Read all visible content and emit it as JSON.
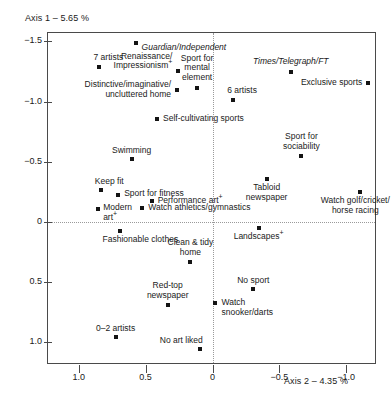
{
  "figure": {
    "axis1_label": "Axis 1 – 5.65 %",
    "axis2_label": "Axis 2 – 4.35 %"
  },
  "chart_data": {
    "type": "scatter",
    "title": "",
    "xlabel": "Axis 2 – 4.35 %",
    "ylabel": "Axis 1 – 5.65 %",
    "xlim": [
      1.23,
      -1.23
    ],
    "ylim": [
      -1.57,
      1.19
    ],
    "x_reversed": true,
    "y_reversed": true,
    "grid": false,
    "legend": "none",
    "zero_lines": true,
    "xticks": [
      1.0,
      0.5,
      0,
      -0.5,
      -1.0
    ],
    "xticklabels": [
      "1.0",
      "0.5",
      "0",
      "-0.5",
      "-1.0"
    ],
    "yticks": [
      -1.5,
      -1.0,
      -0.5,
      0,
      0.5,
      1.0
    ],
    "yticklabels": [
      "-1.5",
      "-1.0",
      "-0.5",
      "0",
      "0.5",
      "1.0"
    ],
    "points": [
      {
        "label": "Guardian/Independent",
        "x": 0.575,
        "y": -1.485,
        "italic": true,
        "anchor": "start",
        "dx": 6,
        "dy": 0,
        "lines": [
          "Guardian/Independent"
        ]
      },
      {
        "label": "7 artists",
        "x": 0.845,
        "y": -1.285,
        "italic": false,
        "anchor": "start",
        "dx": -6,
        "dy": -14,
        "lines": [
          "7 artists"
        ]
      },
      {
        "label": "Renaissance/Impressionism+",
        "x": 0.255,
        "y": -1.255,
        "italic": false,
        "anchor": "end",
        "dx": -6,
        "dy": -19,
        "lines": [
          "Renaissance/",
          "Impressionism+"
        ]
      },
      {
        "label": "Times/Telegraph/FT",
        "x": -0.585,
        "y": -1.245,
        "italic": true,
        "anchor": "mid",
        "dx": 0,
        "dy": -15,
        "lines": [
          "Times/Telegraph/FT"
        ]
      },
      {
        "label": "Exclusive sports",
        "x": -1.165,
        "y": -1.155,
        "italic": false,
        "anchor": "end",
        "dx": -6,
        "dy": -5,
        "lines": [
          "Exclusive sports"
        ]
      },
      {
        "label": "Sport for mental element",
        "x": 0.115,
        "y": -1.115,
        "italic": false,
        "anchor": "mid",
        "dx": 0,
        "dy": -34,
        "lines": [
          "Sport for",
          "mental",
          "element"
        ]
      },
      {
        "label": "6 artists",
        "x": -0.155,
        "y": -1.015,
        "italic": false,
        "anchor": "start",
        "dx": -6,
        "dy": -14,
        "lines": [
          "6 artists"
        ]
      },
      {
        "label": "Distinctive/imaginative/uncluttered home",
        "x": 0.265,
        "y": -1.095,
        "italic": false,
        "anchor": "end",
        "dx": -6,
        "dy": -10,
        "lines": [
          "Distinctive/imaginative/",
          "uncluttered home"
        ]
      },
      {
        "label": "Self-cultivating sports",
        "x": 0.415,
        "y": -0.855,
        "italic": false,
        "anchor": "start",
        "dx": 6,
        "dy": -5,
        "lines": [
          "Self-cultivating sports"
        ]
      },
      {
        "label": "Sport for sociability",
        "x": -0.665,
        "y": -0.545,
        "italic": false,
        "anchor": "mid",
        "dx": 0,
        "dy": -24,
        "lines": [
          "Sport for",
          "sociability"
        ]
      },
      {
        "label": "Swimming",
        "x": 0.605,
        "y": -0.525,
        "italic": false,
        "anchor": "mid",
        "dx": 0,
        "dy": -13,
        "lines": [
          "Swimming"
        ]
      },
      {
        "label": "Tabloid newspaper",
        "x": -0.405,
        "y": -0.355,
        "italic": false,
        "anchor": "mid",
        "dx": 0,
        "dy": 4,
        "lines": [
          "Tabloid",
          "newspaper"
        ]
      },
      {
        "label": "Keep fit",
        "x": 0.835,
        "y": -0.265,
        "italic": false,
        "anchor": "start",
        "dx": -6,
        "dy": -13,
        "lines": [
          "Keep fit"
        ]
      },
      {
        "label": "Sport for fitness",
        "x": 0.705,
        "y": -0.225,
        "italic": false,
        "anchor": "start",
        "dx": 6,
        "dy": -6,
        "lines": [
          "Sport for fitness"
        ]
      },
      {
        "label": "Watch golf/cricket/horse racing",
        "x": -1.105,
        "y": -0.245,
        "italic": false,
        "anchor": "mid",
        "dx": -5,
        "dy": 4,
        "lines": [
          "Watch golf/cricket/",
          "horse racing"
        ]
      },
      {
        "label": "Performance art+",
        "x": 0.455,
        "y": -0.175,
        "italic": false,
        "anchor": "start",
        "dx": 6,
        "dy": -5,
        "lines": [
          "Performance art+"
        ]
      },
      {
        "label": "Watch athletics/gymnastics",
        "x": 0.525,
        "y": -0.115,
        "italic": false,
        "anchor": "start",
        "dx": 6,
        "dy": -5,
        "lines": [
          "Watch athletics/gymnastics"
        ]
      },
      {
        "label": "Modern art+",
        "x": 0.855,
        "y": -0.105,
        "italic": false,
        "anchor": "start",
        "dx": 5,
        "dy": -6,
        "lines": [
          "Modern",
          "art+"
        ]
      },
      {
        "label": "Fashionable clothes",
        "x": 0.695,
        "y": 0.075,
        "italic": false,
        "anchor": "start",
        "dx": -17,
        "dy": 4,
        "lines": [
          "Fashionable clothes"
        ]
      },
      {
        "label": "Landscapes+",
        "x": -0.345,
        "y": 0.055,
        "italic": false,
        "anchor": "mid",
        "dx": 0,
        "dy": 4,
        "lines": [
          "Landscapes+"
        ]
      },
      {
        "label": "Clean & tidy home",
        "x": 0.165,
        "y": 0.335,
        "italic": false,
        "anchor": "mid",
        "dx": 0,
        "dy": -24,
        "lines": [
          "Clean & tidy",
          "home"
        ]
      },
      {
        "label": "No sport",
        "x": -0.305,
        "y": 0.555,
        "italic": false,
        "anchor": "mid",
        "dx": 0,
        "dy": -13,
        "lines": [
          "No sport"
        ]
      },
      {
        "label": "Red-top newspaper",
        "x": 0.335,
        "y": 0.695,
        "italic": false,
        "anchor": "mid",
        "dx": 0,
        "dy": -24,
        "lines": [
          "Red-top",
          "newspaper"
        ]
      },
      {
        "label": "Watch snooker/darts",
        "x": -0.015,
        "y": 0.675,
        "italic": false,
        "anchor": "start",
        "dx": 7,
        "dy": -5,
        "lines": [
          "Watch",
          "snooker/darts"
        ]
      },
      {
        "label": "0–2 artists",
        "x": 0.725,
        "y": 0.955,
        "italic": false,
        "anchor": "mid",
        "dx": 0,
        "dy": -13,
        "lines": [
          "0–2 artists"
        ]
      },
      {
        "label": "No art liked",
        "x": 0.095,
        "y": 1.055,
        "italic": false,
        "anchor": "end",
        "dx": 3,
        "dy": -13,
        "lines": [
          "No art liked"
        ]
      }
    ]
  }
}
